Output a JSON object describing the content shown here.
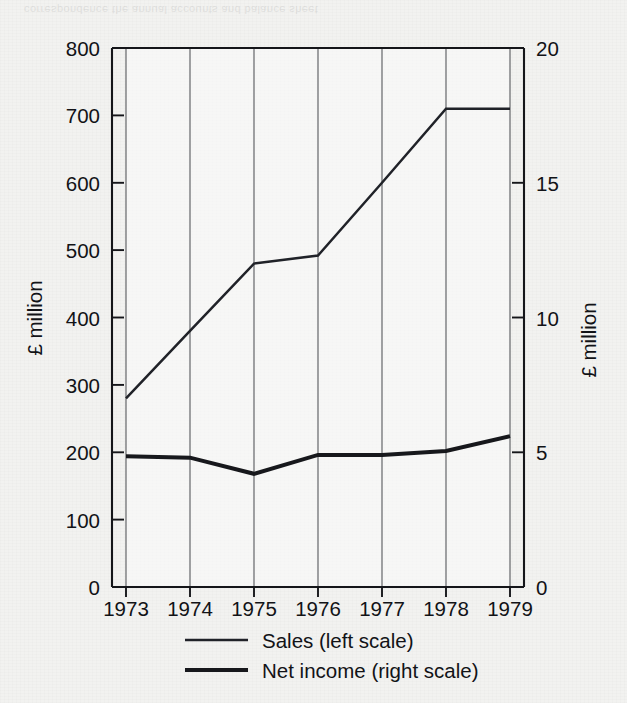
{
  "chart_data": {
    "type": "line",
    "title": "",
    "xlabel": "",
    "categories": [
      "1973",
      "1974",
      "1975",
      "1976",
      "1977",
      "1978",
      "1979"
    ],
    "x": [
      1973,
      1974,
      1975,
      1976,
      1977,
      1978,
      1979
    ],
    "grid": true,
    "legend_position": "bottom",
    "left_axis": {
      "label": "£ million",
      "ylim": [
        0,
        800
      ],
      "ticks": [
        0,
        100,
        200,
        300,
        400,
        500,
        600,
        700,
        800
      ],
      "tick_labels": [
        "0",
        "100",
        "200",
        "300",
        "400",
        "500",
        "600",
        "700",
        "800"
      ]
    },
    "right_axis": {
      "label": "£ million",
      "ylim": [
        0,
        20
      ],
      "ticks": [
        0,
        5,
        10,
        15,
        20
      ],
      "tick_labels": [
        "0",
        "5",
        "10",
        "15",
        "20"
      ]
    },
    "series": [
      {
        "name": "Sales (left scale)",
        "axis": "left",
        "style": "thin",
        "values": [
          280,
          380,
          480,
          492,
          600,
          710,
          710
        ]
      },
      {
        "name": "Net income (right scale)",
        "axis": "right",
        "style": "thick",
        "values": [
          4.85,
          4.8,
          4.2,
          4.9,
          4.9,
          5.05,
          5.6
        ]
      }
    ]
  },
  "legend": {
    "items": [
      {
        "label": "Sales (left scale)",
        "style": "thin"
      },
      {
        "label": "Net income (right scale)",
        "style": "thick"
      }
    ]
  },
  "axes": {
    "left_title": "£ million",
    "right_title": "£ million",
    "left_ticks": [
      "800",
      "700",
      "600",
      "500",
      "400",
      "300",
      "200",
      "100",
      "0"
    ],
    "right_ticks": [
      "20",
      "15",
      "10",
      "5",
      "0"
    ],
    "x_ticks": [
      "1973",
      "1974",
      "1975",
      "1976",
      "1977",
      "1978",
      "1979"
    ]
  },
  "page": {
    "bleed_through_text": "correspondence  the  annual  accounts  and  balance  sheet"
  }
}
